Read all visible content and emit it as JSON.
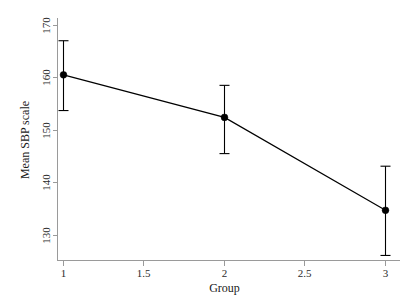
{
  "chart_data": {
    "type": "line",
    "title": "",
    "xlabel": "Group",
    "ylabel": "Mean SBP scale",
    "x": [
      1,
      2,
      3
    ],
    "values": [
      160.6,
      152.5,
      134.8
    ],
    "series": [
      {
        "name": "Mean SBP scale",
        "values": [
          160.6,
          152.5,
          134.8
        ],
        "error_low": [
          153.8,
          145.6,
          126.2
        ],
        "error_high": [
          167.1,
          158.6,
          143.2
        ]
      }
    ],
    "xlim": [
      1,
      3
    ],
    "ylim": [
      126.0,
      170.5
    ],
    "xticks": [
      1,
      1.5,
      2,
      2.5,
      3
    ],
    "xtick_labels": [
      "1",
      "1.5",
      "2",
      "2.5",
      "3"
    ],
    "yticks": [
      130,
      140,
      150,
      160,
      170
    ],
    "ytick_labels": [
      "130",
      "140",
      "150",
      "160",
      "170"
    ],
    "grid": false,
    "legend": null,
    "marker": "filled-circle",
    "error_bars": true,
    "colors": {
      "line": "#000000",
      "marker": "#000000",
      "error_bar": "#000000",
      "axis": "#9a9a9a",
      "text": "#1a1a1a",
      "background": "#ffffff"
    }
  },
  "axes": {
    "y_axis_label": "Mean SBP scale",
    "x_axis_label": "Group",
    "y_tick_labels": [
      "170",
      "160",
      "150",
      "140",
      "130"
    ],
    "x_tick_labels": [
      "1",
      "1.5",
      "2",
      "2.5",
      "3"
    ]
  }
}
